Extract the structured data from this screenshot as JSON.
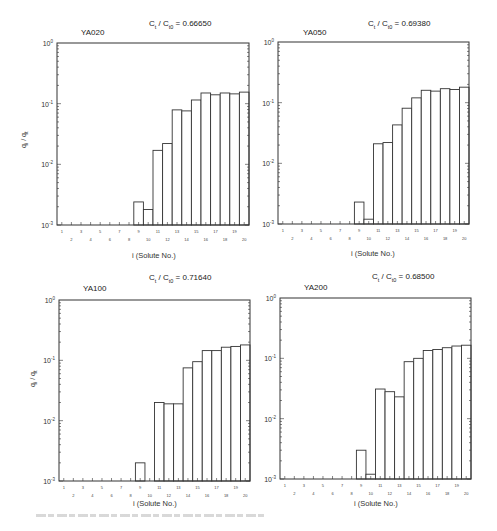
{
  "chart_data": [
    {
      "type": "bar",
      "title": "YA020",
      "subtitle": "Ct / Ct0 = 0.66650",
      "ratio_value": "0.66650",
      "xlabel": "i  (Solute No.)",
      "ylabel": "qi / qt",
      "yscale": "log",
      "ylim": [
        0.001,
        1
      ],
      "yticks": [
        "10^-3",
        "10^-2",
        "10^-1",
        "10^0"
      ],
      "categories": [
        1,
        2,
        3,
        4,
        5,
        6,
        7,
        8,
        9,
        10,
        11,
        12,
        13,
        14,
        15,
        16,
        17,
        18,
        19,
        20
      ],
      "bars": {
        "x": [
          9,
          10,
          11,
          12,
          13,
          14,
          15,
          16,
          17,
          18,
          19,
          20
        ],
        "values": [
          0.0024,
          0.0018,
          0.017,
          0.022,
          0.079,
          0.076,
          0.115,
          0.15,
          0.14,
          0.15,
          0.145,
          0.155
        ]
      },
      "grid": false
    },
    {
      "type": "bar",
      "title": "YA050",
      "subtitle": "Ct / Ct0 = 0.69380",
      "ratio_value": "0.69380",
      "xlabel": "i  (Solute No.)",
      "ylabel": "qi / qt",
      "yscale": "log",
      "ylim": [
        0.001,
        1
      ],
      "yticks": [
        "10^-3",
        "10^-2",
        "10^-1",
        "10^0"
      ],
      "categories": [
        1,
        2,
        3,
        4,
        5,
        6,
        7,
        8,
        9,
        10,
        11,
        12,
        13,
        14,
        15,
        16,
        17,
        18,
        19,
        20
      ],
      "bars": {
        "x": [
          9,
          10,
          11,
          12,
          13,
          14,
          15,
          16,
          17,
          18,
          19,
          20
        ],
        "values": [
          0.0023,
          0.0012,
          0.021,
          0.022,
          0.043,
          0.081,
          0.12,
          0.16,
          0.155,
          0.17,
          0.165,
          0.18
        ]
      },
      "grid": false
    },
    {
      "type": "bar",
      "title": "YA100",
      "subtitle": "Ct / Ct0 = 0.71640",
      "ratio_value": "0.71640",
      "xlabel": "i  (Solute No.)",
      "ylabel": "qi / qt",
      "yscale": "log",
      "ylim": [
        0.001,
        1
      ],
      "yticks": [
        "10^-3",
        "10^-2",
        "10^-1",
        "10^0"
      ],
      "categories": [
        1,
        2,
        3,
        4,
        5,
        6,
        7,
        8,
        9,
        10,
        11,
        12,
        13,
        14,
        15,
        16,
        17,
        18,
        19,
        20
      ],
      "bars": {
        "x": [
          9,
          10,
          11,
          12,
          13,
          14,
          15,
          16,
          17,
          18,
          19,
          20
        ],
        "values": [
          0.002,
          0.001,
          0.02,
          0.019,
          0.019,
          0.075,
          0.095,
          0.145,
          0.145,
          0.165,
          0.17,
          0.18
        ]
      },
      "grid": false
    },
    {
      "type": "bar",
      "title": "YA200",
      "subtitle": "Ct / Ct0 = 0.68500",
      "ratio_value": "0.68500",
      "xlabel": "i  (Solute No.)",
      "ylabel": "qi / qt",
      "yscale": "log",
      "ylim": [
        0.001,
        1
      ],
      "yticks": [
        "10^-3",
        "10^-2",
        "10^-1",
        "10^0"
      ],
      "categories": [
        1,
        2,
        3,
        4,
        5,
        6,
        7,
        8,
        9,
        10,
        11,
        12,
        13,
        14,
        15,
        16,
        17,
        18,
        19,
        20
      ],
      "bars": {
        "x": [
          9,
          10,
          11,
          12,
          13,
          14,
          15,
          16,
          17,
          18,
          19,
          20
        ],
        "values": [
          0.003,
          0.0012,
          0.031,
          0.028,
          0.023,
          0.088,
          0.1,
          0.135,
          0.14,
          0.15,
          0.16,
          0.165
        ]
      },
      "grid": false
    }
  ],
  "labels": {
    "ratio_prefix_c": "C",
    "ratio_sub_t": "t",
    "ratio_sep": " / C",
    "ratio_sub_t0": "t0",
    "ratio_eq": " = ",
    "xlabel": "i  (Solute No.)",
    "ylabel_q": "q",
    "ylabel_i": "i",
    "ylabel_sep": " / q",
    "ylabel_t": "t"
  },
  "panels": [
    {
      "title": "YA020",
      "ratio": "0.66650"
    },
    {
      "title": "YA050",
      "ratio": "0.69380"
    },
    {
      "title": "YA100",
      "ratio": "0.71640"
    },
    {
      "title": "YA200",
      "ratio": "0.68500"
    }
  ]
}
